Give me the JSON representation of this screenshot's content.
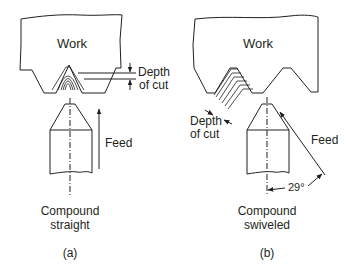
{
  "figure": {
    "panel_a": {
      "work_label": "Work",
      "depth_label_line1": "Depth",
      "depth_label_line2": "of cut",
      "feed_label": "Feed",
      "caption_line1": "Compound",
      "caption_line2": "straight",
      "panel_label": "(a)"
    },
    "panel_b": {
      "work_label": "Work",
      "depth_label_line1": "Depth",
      "depth_label_line2": "of cut",
      "feed_label": "Feed",
      "angle_label": "29°",
      "caption_line1": "Compound",
      "caption_line2": "swiveled",
      "panel_label": "(b)"
    },
    "colors": {
      "line": "#231f20",
      "background": "#ffffff"
    }
  }
}
